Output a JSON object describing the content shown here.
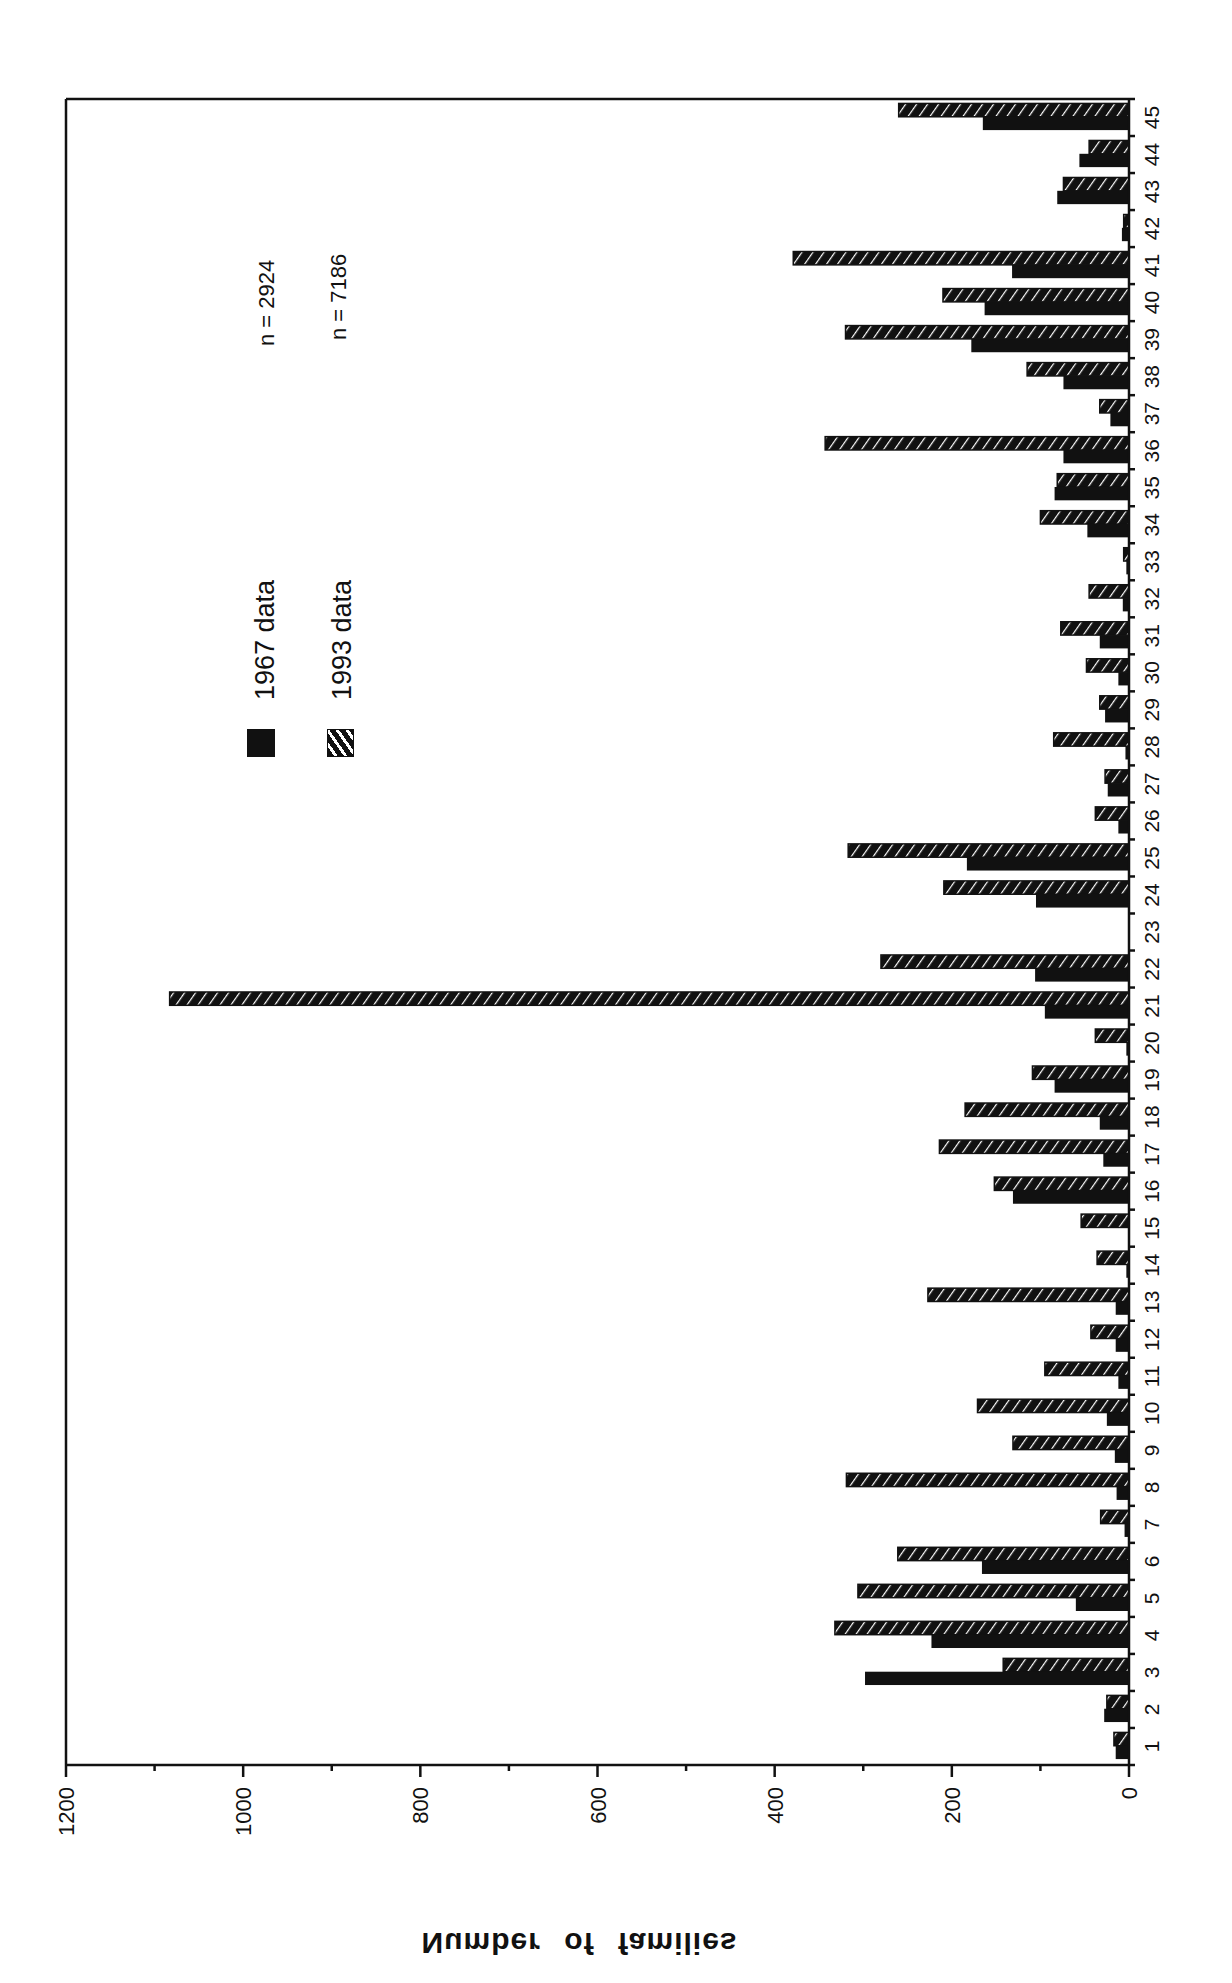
{
  "chart_data": {
    "type": "bar",
    "orientation": "rotated-90-clockwise (value axis horizontal, 0 at right; categories stacked vertically, 1 at bottom)",
    "title": "",
    "xlabel": "",
    "ylabel": "Number of families",
    "ylim": [
      0,
      1200
    ],
    "yticks": [
      0,
      200,
      400,
      600,
      800,
      1000,
      1200
    ],
    "yticks_minor": [
      100,
      300,
      500,
      700,
      900,
      1100
    ],
    "grid": false,
    "categories": [
      "1",
      "2",
      "3",
      "4",
      "5",
      "6",
      "7",
      "8",
      "9",
      "10",
      "11",
      "12",
      "13",
      "14",
      "15",
      "16",
      "17",
      "18",
      "19",
      "20",
      "21",
      "22",
      "23",
      "24",
      "25",
      "26",
      "27",
      "28",
      "29",
      "30",
      "31",
      "32",
      "33",
      "34",
      "35",
      "36",
      "37",
      "38",
      "39",
      "40",
      "41",
      "42",
      "43",
      "44",
      "45"
    ],
    "series": [
      {
        "name": "1967 data",
        "style": "solid-black",
        "n": 2924,
        "values": [
          15,
          28,
          298,
          223,
          60,
          166,
          5,
          14,
          16,
          25,
          12,
          15,
          15,
          3,
          0,
          131,
          29,
          33,
          84,
          3,
          95,
          106,
          0,
          105,
          183,
          12,
          24,
          4,
          27,
          12,
          33,
          7,
          3,
          47,
          84,
          74,
          21,
          74,
          178,
          163,
          132,
          8,
          81,
          56,
          165
        ]
      },
      {
        "name": "1993 data",
        "style": "hatched",
        "n": 7186,
        "values": [
          17,
          25,
          142,
          332,
          306,
          261,
          32,
          319,
          131,
          171,
          95,
          43,
          227,
          36,
          54,
          152,
          214,
          185,
          109,
          38,
          1083,
          280,
          0,
          209,
          317,
          38,
          27,
          85,
          33,
          48,
          77,
          45,
          6,
          100,
          81,
          343,
          33,
          115,
          320,
          210,
          379,
          6,
          74,
          45,
          260
        ]
      }
    ],
    "legend": [
      {
        "label": "1967 data",
        "swatch": "solid-black",
        "n_label": "n = 2924"
      },
      {
        "label": "1993 data",
        "swatch": "hatched",
        "n_label": "n = 7186"
      }
    ],
    "legend_position": "upper-left inside plot (rotated)"
  },
  "labels": {
    "axis_title": "Number of families",
    "legend_1967": "1967 data",
    "legend_1993": "1993 data",
    "n_1967": "n = 2924",
    "n_1993": "n = 7186"
  },
  "colors": {
    "bar_1967": "#111111",
    "bar_1993_fill": "#111111",
    "bar_1993_stripe": "#ffffff",
    "axis": "#111111",
    "background": "#ffffff"
  }
}
